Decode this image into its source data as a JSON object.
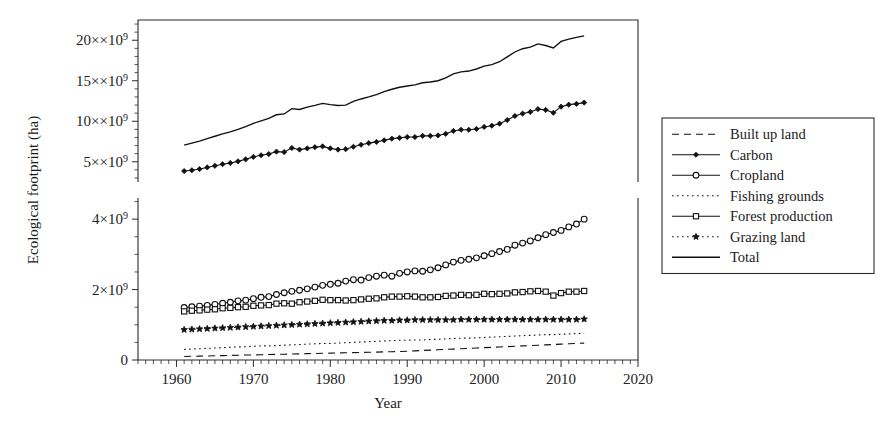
{
  "figure": {
    "background": "#ffffff",
    "ink_color": "#111111"
  },
  "axis": {
    "xlabel": "Year",
    "ylabel": "Ecological footprint (ha)",
    "x_ticks": [
      "1960",
      "1970",
      "1980",
      "1990",
      "2000",
      "2010",
      "2020"
    ],
    "x_tick_values": [
      1960,
      1970,
      1980,
      1990,
      2000,
      2010,
      2020
    ],
    "upper_y_ticks": [
      "5×10⁹",
      "10×10⁹",
      "15×10⁹",
      "20×10⁹"
    ],
    "upper_y_tick_values": [
      5000000000,
      10000000000,
      15000000000,
      20000000000
    ],
    "lower_y_ticks": [
      "0",
      "2×10⁹",
      "4×10⁹"
    ],
    "lower_y_tick_values": [
      0,
      2000000000,
      4000000000
    ]
  },
  "legend": {
    "position": "right",
    "entries": [
      {
        "label": "Built up land",
        "style": "dashed",
        "marker": "none"
      },
      {
        "label": "Carbon",
        "style": "solid-marker",
        "marker": "filled-diamond"
      },
      {
        "label": "Cropland",
        "style": "solid-marker",
        "marker": "open-circle"
      },
      {
        "label": "Fishing grounds",
        "style": "dotted",
        "marker": "none"
      },
      {
        "label": "Forest production",
        "style": "solid-marker",
        "marker": "open-square"
      },
      {
        "label": "Grazing land",
        "style": "dotted-marker",
        "marker": "filled-star"
      },
      {
        "label": "Total",
        "style": "solid",
        "marker": "none"
      }
    ]
  },
  "chart_data": {
    "type": "line",
    "title": "",
    "xlabel": "Year",
    "ylabel": "Ecological footprint (ha)",
    "panels": [
      {
        "name": "upper",
        "ylim": [
          2500000000,
          22500000000
        ],
        "y_ticks": [
          5000000000,
          10000000000,
          15000000000,
          20000000000
        ],
        "grid": false,
        "series": [
          "Total",
          "Carbon"
        ]
      },
      {
        "name": "lower",
        "ylim": [
          0,
          4600000000
        ],
        "y_ticks": [
          0,
          2000000000,
          4000000000
        ],
        "grid": false,
        "series": [
          "Cropland",
          "Forest production",
          "Grazing land",
          "Fishing grounds",
          "Built up land"
        ]
      }
    ],
    "xlim": [
      1955,
      2020
    ],
    "x": [
      1961,
      1962,
      1963,
      1964,
      1965,
      1966,
      1967,
      1968,
      1969,
      1970,
      1971,
      1972,
      1973,
      1974,
      1975,
      1976,
      1977,
      1978,
      1979,
      1980,
      1981,
      1982,
      1983,
      1984,
      1985,
      1986,
      1987,
      1988,
      1989,
      1990,
      1991,
      1992,
      1993,
      1994,
      1995,
      1996,
      1997,
      1998,
      1999,
      2000,
      2001,
      2002,
      2003,
      2004,
      2005,
      2006,
      2007,
      2008,
      2009,
      2010,
      2011,
      2012,
      2013
    ],
    "series": [
      {
        "name": "Total",
        "panel": "upper",
        "style": "solid",
        "marker": "none",
        "values": [
          7050000000.0,
          7300000000.0,
          7550000000.0,
          7850000000.0,
          8150000000.0,
          8450000000.0,
          8700000000.0,
          9000000000.0,
          9350000000.0,
          9750000000.0,
          10050000000.0,
          10350000000.0,
          10800000000.0,
          10900000000.0,
          11550000000.0,
          11450000000.0,
          11750000000.0,
          11950000000.0,
          12200000000.0,
          12050000000.0,
          11950000000.0,
          12000000000.0,
          12450000000.0,
          12750000000.0,
          13000000000.0,
          13300000000.0,
          13650000000.0,
          13950000000.0,
          14200000000.0,
          14350000000.0,
          14500000000.0,
          14750000000.0,
          14850000000.0,
          15000000000.0,
          15350000000.0,
          15850000000.0,
          16100000000.0,
          16200000000.0,
          16450000000.0,
          16800000000.0,
          17000000000.0,
          17350000000.0,
          17950000000.0,
          18550000000.0,
          18950000000.0,
          19150000000.0,
          19550000000.0,
          19350000000.0,
          19050000000.0,
          19850000000.0,
          20150000000.0,
          20350000000.0,
          20550000000.0
        ]
      },
      {
        "name": "Carbon",
        "panel": "upper",
        "style": "solid",
        "marker": "filled-diamond",
        "values": [
          3850000000.0,
          3950000000.0,
          4100000000.0,
          4300000000.0,
          4500000000.0,
          4700000000.0,
          4850000000.0,
          5050000000.0,
          5300000000.0,
          5600000000.0,
          5800000000.0,
          5950000000.0,
          6250000000.0,
          6200000000.0,
          6700000000.0,
          6500000000.0,
          6650000000.0,
          6800000000.0,
          6900000000.0,
          6650000000.0,
          6500000000.0,
          6550000000.0,
          6850000000.0,
          7100000000.0,
          7300000000.0,
          7450000000.0,
          7650000000.0,
          7850000000.0,
          7950000000.0,
          8050000000.0,
          8050000000.0,
          8200000000.0,
          8200000000.0,
          8250000000.0,
          8450000000.0,
          8800000000.0,
          8950000000.0,
          8950000000.0,
          9050000000.0,
          9300000000.0,
          9450000000.0,
          9700000000.0,
          10150000000.0,
          10650000000.0,
          10950000000.0,
          11150000000.0,
          11500000000.0,
          11400000000.0,
          11050000000.0,
          11800000000.0,
          12050000000.0,
          12150000000.0,
          12300000000.0
        ]
      },
      {
        "name": "Cropland",
        "panel": "lower",
        "style": "solid",
        "marker": "open-circle",
        "values": [
          1490000000.0,
          1510000000.0,
          1530000000.0,
          1550000000.0,
          1580000000.0,
          1610000000.0,
          1640000000.0,
          1680000000.0,
          1700000000.0,
          1740000000.0,
          1780000000.0,
          1800000000.0,
          1860000000.0,
          1910000000.0,
          1950000000.0,
          1980000000.0,
          2020000000.0,
          2070000000.0,
          2120000000.0,
          2150000000.0,
          2180000000.0,
          2240000000.0,
          2280000000.0,
          2270000000.0,
          2340000000.0,
          2380000000.0,
          2410000000.0,
          2380000000.0,
          2460000000.0,
          2500000000.0,
          2530000000.0,
          2520000000.0,
          2560000000.0,
          2620000000.0,
          2700000000.0,
          2780000000.0,
          2830000000.0,
          2860000000.0,
          2900000000.0,
          2960000000.0,
          3020000000.0,
          3080000000.0,
          3140000000.0,
          3260000000.0,
          3320000000.0,
          3380000000.0,
          3470000000.0,
          3560000000.0,
          3620000000.0,
          3680000000.0,
          3780000000.0,
          3860000000.0,
          4000000000.0
        ]
      },
      {
        "name": "Forest production",
        "panel": "lower",
        "style": "solid",
        "marker": "open-square",
        "values": [
          1380000000.0,
          1400000000.0,
          1410000000.0,
          1430000000.0,
          1440000000.0,
          1470000000.0,
          1480000000.0,
          1500000000.0,
          1510000000.0,
          1540000000.0,
          1550000000.0,
          1560000000.0,
          1600000000.0,
          1610000000.0,
          1600000000.0,
          1640000000.0,
          1660000000.0,
          1680000000.0,
          1710000000.0,
          1700000000.0,
          1700000000.0,
          1690000000.0,
          1700000000.0,
          1720000000.0,
          1740000000.0,
          1750000000.0,
          1780000000.0,
          1800000000.0,
          1800000000.0,
          1810000000.0,
          1800000000.0,
          1780000000.0,
          1780000000.0,
          1790000000.0,
          1820000000.0,
          1830000000.0,
          1850000000.0,
          1840000000.0,
          1850000000.0,
          1880000000.0,
          1870000000.0,
          1880000000.0,
          1890000000.0,
          1920000000.0,
          1930000000.0,
          1950000000.0,
          1960000000.0,
          1940000000.0,
          1830000000.0,
          1900000000.0,
          1940000000.0,
          1940000000.0,
          1960000000.0
        ]
      },
      {
        "name": "Grazing land",
        "panel": "lower",
        "style": "dotted",
        "marker": "filled-star",
        "values": [
          860000000.0,
          870000000.0,
          880000000.0,
          890000000.0,
          900000000.0,
          910000000.0,
          920000000.0,
          930000000.0,
          940000000.0,
          950000000.0,
          960000000.0,
          970000000.0,
          980000000.0,
          990000000.0,
          1000000000.0,
          1010000000.0,
          1020000000.0,
          1030000000.0,
          1040000000.0,
          1050000000.0,
          1060000000.0,
          1070000000.0,
          1080000000.0,
          1090000000.0,
          1100000000.0,
          1110000000.0,
          1120000000.0,
          1120000000.0,
          1130000000.0,
          1130000000.0,
          1140000000.0,
          1140000000.0,
          1140000000.0,
          1140000000.0,
          1140000000.0,
          1140000000.0,
          1150000000.0,
          1150000000.0,
          1150000000.0,
          1150000000.0,
          1150000000.0,
          1150000000.0,
          1150000000.0,
          1150000000.0,
          1150000000.0,
          1150000000.0,
          1150000000.0,
          1150000000.0,
          1150000000.0,
          1150000000.0,
          1150000000.0,
          1150000000.0,
          1160000000.0
        ]
      },
      {
        "name": "Fishing grounds",
        "panel": "lower",
        "style": "dotted",
        "marker": "none",
        "values": [
          300000000.0,
          310000000.0,
          320000000.0,
          330000000.0,
          340000000.0,
          350000000.0,
          360000000.0,
          370000000.0,
          380000000.0,
          390000000.0,
          400000000.0,
          400000000.0,
          410000000.0,
          420000000.0,
          430000000.0,
          440000000.0,
          450000000.0,
          460000000.0,
          470000000.0,
          470000000.0,
          480000000.0,
          490000000.0,
          500000000.0,
          510000000.0,
          520000000.0,
          530000000.0,
          540000000.0,
          550000000.0,
          560000000.0,
          560000000.0,
          570000000.0,
          570000000.0,
          580000000.0,
          590000000.0,
          600000000.0,
          610000000.0,
          620000000.0,
          620000000.0,
          630000000.0,
          640000000.0,
          650000000.0,
          660000000.0,
          670000000.0,
          680000000.0,
          690000000.0,
          700000000.0,
          710000000.0,
          720000000.0,
          720000000.0,
          730000000.0,
          740000000.0,
          750000000.0,
          760000000.0
        ]
      },
      {
        "name": "Built up land",
        "panel": "lower",
        "style": "dashed",
        "marker": "none",
        "values": [
          100000000.0,
          105000000.0,
          110000000.0,
          115000000.0,
          120000000.0,
          125000000.0,
          130000000.0,
          135000000.0,
          140000000.0,
          145000000.0,
          150000000.0,
          155000000.0,
          160000000.0,
          165000000.0,
          170000000.0,
          175000000.0,
          180000000.0,
          185000000.0,
          190000000.0,
          195000000.0,
          200000000.0,
          205000000.0,
          210000000.0,
          215000000.0,
          220000000.0,
          225000000.0,
          230000000.0,
          235000000.0,
          240000000.0,
          250000000.0,
          260000000.0,
          270000000.0,
          280000000.0,
          290000000.0,
          300000000.0,
          310000000.0,
          320000000.0,
          330000000.0,
          340000000.0,
          350000000.0,
          360000000.0,
          370000000.0,
          380000000.0,
          390000000.0,
          400000000.0,
          410000000.0,
          420000000.0,
          430000000.0,
          440000000.0,
          450000000.0,
          460000000.0,
          470000000.0,
          480000000.0
        ]
      }
    ]
  }
}
